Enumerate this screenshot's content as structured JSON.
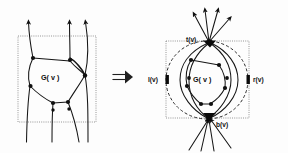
{
  "figure": {
    "background_color": "#fdfdfd",
    "ink_color": "#101010",
    "box_color": "#8a8a8a",
    "width": 288,
    "height": 153
  },
  "left_panel": {
    "region_label": "G( v )",
    "boundary_box": {
      "x": 18,
      "y": 36,
      "width": 78,
      "height": 86,
      "style": "dotted"
    },
    "description": "Planar subgraph inside dotted box with three edge strands entering from the bottom and leaving upward through the top, two strands crossing near the right",
    "arrow_count_top": 3,
    "strand_count_bottom": 3,
    "node_count": 6
  },
  "implication": {
    "symbol": "double-right-arrow",
    "glyph": "⟹",
    "x": 116,
    "y": 77
  },
  "right_panel": {
    "region_label": "G( v )",
    "boundary_box": {
      "x": 165,
      "y": 40,
      "width": 84,
      "height": 78,
      "style": "dotted"
    },
    "enclosing_circle_style": "dashed",
    "terminals": [
      {
        "id": "t",
        "label": "t(v)",
        "position": "top",
        "x": 188,
        "y": 42
      },
      {
        "id": "l",
        "label": "l(v)",
        "position": "left",
        "x": 156,
        "y": 80
      },
      {
        "id": "r",
        "label": "r(v)",
        "position": "right",
        "x": 258,
        "y": 80
      },
      {
        "id": "b",
        "label": "b(v)",
        "position": "bottom",
        "x": 228,
        "y": 126
      }
    ],
    "out_arrow_count_top": 4,
    "in_arrow_count_bottom": 4,
    "node_count": 8,
    "description": "Same subgraph contracted so that all upward strands meet at top terminal t(v) and all downward strands meet at bottom terminal b(v); side terminals l(v) and r(v) sit on the dashed circle"
  }
}
